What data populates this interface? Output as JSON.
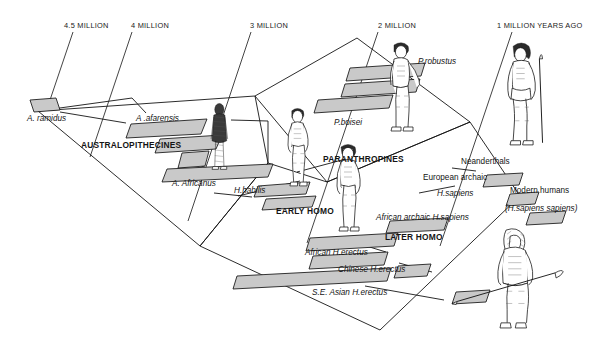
{
  "figure": {
    "type": "timeline-diagram",
    "background_color": "#ffffff",
    "ink_color": "#141414",
    "bar_fill_color": "#c9c9c9",
    "bar_stroke_color": "#141414"
  },
  "time_axis": {
    "orientation": "top",
    "direction": "older-left-to-younger-right",
    "ticks": [
      {
        "id": "tick-4-5",
        "label": "4.5 MILLION",
        "x": 64,
        "y": 22
      },
      {
        "id": "tick-4",
        "label": "4 MILLION",
        "x": 131,
        "y": 22
      },
      {
        "id": "tick-3",
        "label": "3 MILLION",
        "x": 250,
        "y": 22
      },
      {
        "id": "tick-2",
        "label": "2 MILLION",
        "x": 378,
        "y": 22
      },
      {
        "id": "tick-1",
        "label": "1 MILLION YEARS AGO",
        "x": 497,
        "y": 22
      }
    ]
  },
  "group_labels": [
    {
      "id": "group-australopithecines",
      "label": "AUSTRALOPITHECINES",
      "x": 81,
      "y": 141
    },
    {
      "id": "group-paranthropines",
      "label": "PARANTHROPINES",
      "x": 323,
      "y": 155
    },
    {
      "id": "group-early-homo",
      "label": "EARLY HOMO",
      "x": 276,
      "y": 207
    },
    {
      "id": "group-later-homo",
      "label": "LATER HOMO",
      "x": 385,
      "y": 233
    }
  ],
  "taxa": [
    {
      "id": "taxon-a-ramidus",
      "label": "A. ramidus",
      "style": "italic",
      "x": 27,
      "y": 115
    },
    {
      "id": "taxon-a-afarensis",
      "label": "A .afarensis",
      "style": "italic",
      "x": 136,
      "y": 115
    },
    {
      "id": "taxon-a-africanus",
      "label": "A. Africanus",
      "style": "italic",
      "x": 172,
      "y": 180
    },
    {
      "id": "taxon-h-habilis",
      "label": "H.habilis",
      "style": "italic",
      "x": 234,
      "y": 187
    },
    {
      "id": "taxon-p-boisei",
      "label": "P.boisei",
      "style": "italic",
      "x": 334,
      "y": 119
    },
    {
      "id": "taxon-p-robustus",
      "label": "P.robustus",
      "style": "italic",
      "x": 418,
      "y": 58
    },
    {
      "id": "taxon-neanderthals",
      "label": "Neanderthals",
      "style": "normal",
      "x": 461,
      "y": 158
    },
    {
      "id": "taxon-european-archaic",
      "label": "European archaic",
      "style": "normal",
      "x": 423,
      "y": 174
    },
    {
      "id": "taxon-european-archaic-species",
      "label": "H.sapiens",
      "style": "italic",
      "x": 437,
      "y": 190
    },
    {
      "id": "taxon-modern-humans",
      "label": "Modern humans",
      "style": "normal",
      "x": 510,
      "y": 187
    },
    {
      "id": "taxon-modern-humans-species",
      "label": "(H.sapiens sapiens)",
      "style": "italic",
      "x": 505,
      "y": 205
    },
    {
      "id": "taxon-african-archaic-h-sapiens",
      "label": "African archaic H.sapiens",
      "style": "italic",
      "x": 376,
      "y": 214
    },
    {
      "id": "taxon-african-h-erectus",
      "label": "African H.erectus",
      "style": "italic",
      "x": 305,
      "y": 249
    },
    {
      "id": "taxon-chinese-h-erectus",
      "label": "Chinese H.erectus",
      "style": "italic",
      "x": 338,
      "y": 266
    },
    {
      "id": "taxon-se-asian-h-erectus",
      "label": "S.E. Asian H.erectus",
      "style": "italic",
      "x": 312,
      "y": 289
    }
  ],
  "range_bars": [
    {
      "id": "bar-a-ramidus",
      "taxon": "A. ramidus"
    },
    {
      "id": "bar-a-afarensis",
      "taxon": "A .afarensis"
    },
    {
      "id": "bar-a-afarensis-2",
      "taxon": "A .afarensis"
    },
    {
      "id": "bar-a-africanus",
      "taxon": "A. Africanus"
    },
    {
      "id": "bar-h-habilis",
      "taxon": "H.habilis"
    },
    {
      "id": "bar-h-habilis-2",
      "taxon": "H.habilis"
    },
    {
      "id": "bar-p-boisei",
      "taxon": "P.boisei"
    },
    {
      "id": "bar-p-robustus-1",
      "taxon": "P.robustus"
    },
    {
      "id": "bar-p-robustus-2",
      "taxon": "P.robustus"
    },
    {
      "id": "bar-african-h-erectus",
      "taxon": "African H.erectus"
    },
    {
      "id": "bar-chinese-h-erectus",
      "taxon": "Chinese H.erectus"
    },
    {
      "id": "bar-se-asian-h-erectus",
      "taxon": "S.E. Asian H.erectus"
    },
    {
      "id": "bar-african-archaic-h-sapiens",
      "taxon": "African archaic H.sapiens"
    },
    {
      "id": "bar-european-archaic-h-sapiens",
      "taxon": "European archaic H.sapiens"
    },
    {
      "id": "bar-neanderthals",
      "taxon": "Neanderthals"
    },
    {
      "id": "bar-modern-humans",
      "taxon": "Modern humans"
    }
  ],
  "figures": [
    {
      "id": "figure-afarensis",
      "description": "hairy upright australopithecine figure"
    },
    {
      "id": "figure-habilis",
      "description": "standing early homo figure"
    },
    {
      "id": "figure-erectus",
      "description": "standing homo erectus figure"
    },
    {
      "id": "figure-paranthropus",
      "description": "stooping robust paranthropine figure"
    },
    {
      "id": "figure-archaic-sapiens",
      "description": "standing human holding a spear"
    },
    {
      "id": "figure-modern-human",
      "description": "hooded modern human carrying a spear"
    }
  ]
}
